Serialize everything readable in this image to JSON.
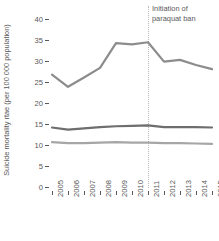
{
  "chart_data": {
    "type": "line",
    "title": "",
    "xlabel": "",
    "ylabel": "Suicide mortality rtae (per 100 000 population)",
    "x": [
      2005,
      2006,
      2007,
      2008,
      2009,
      2010,
      2011,
      2012,
      2013,
      2014,
      2015
    ],
    "categories": [
      "2005",
      "2006",
      "2007",
      "2008",
      "2009",
      "2010",
      "2011",
      "2012",
      "2013",
      "2014",
      "2015"
    ],
    "ylim": [
      0,
      40
    ],
    "yticks": [
      0,
      5,
      10,
      15,
      20,
      25,
      30,
      35,
      40
    ],
    "ytick_labels": [
      "0",
      "5",
      "10",
      "15",
      "20",
      "25",
      "30",
      "35",
      "40"
    ],
    "grid": false,
    "legend": "none",
    "series": [
      {
        "name": "elderly-suicide-rate",
        "color": "#8c8c8e",
        "values": [
          27.0,
          24.1,
          26.3,
          28.6,
          34.5,
          34.2,
          34.7,
          30.1,
          30.5,
          29.3,
          28.3
        ]
      },
      {
        "name": "male-suicide-rate",
        "color": "#6e6e70",
        "values": [
          14.4,
          13.9,
          14.2,
          14.5,
          14.7,
          14.8,
          14.9,
          14.5,
          14.5,
          14.5,
          14.4
        ]
      },
      {
        "name": "overall-suicide-rate",
        "color": "#a6a6a8",
        "values": [
          10.9,
          10.7,
          10.7,
          10.8,
          10.9,
          10.8,
          10.8,
          10.7,
          10.7,
          10.6,
          10.5
        ]
      }
    ],
    "annotations": [
      {
        "text": "Initiation of\nparaquat ban",
        "x": 2011,
        "type": "vertical-reference-line",
        "line_color": "#b9b9bb",
        "line_style": "dotted"
      }
    ]
  },
  "axis": {
    "y_title": "Suicide mortality rtae (per 100 000 population)"
  },
  "annotation": {
    "label": "Initiation of\nparaquat ban"
  },
  "colors": {
    "text": "#58585a",
    "series_1": "#8c8c8e",
    "series_2": "#6e6e70",
    "series_3": "#a6a6a8",
    "reference_line": "#b9b9bb",
    "background": "#ffffff"
  }
}
